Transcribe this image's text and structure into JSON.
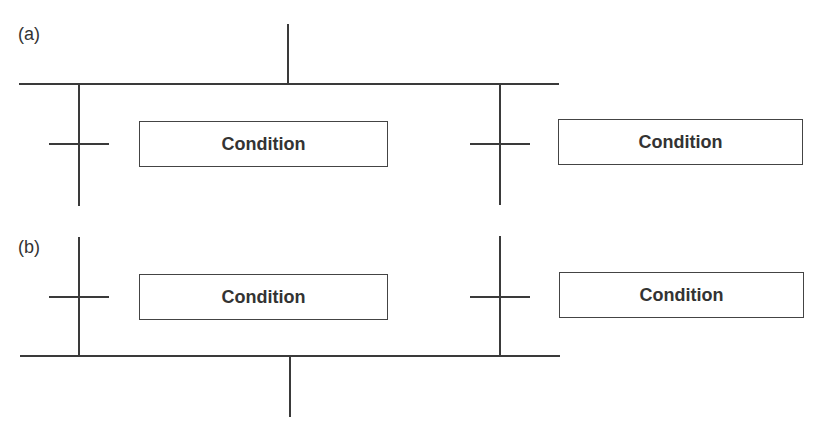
{
  "diagram": {
    "type": "sequential-function-chart-branches",
    "colors": {
      "line": "#3a3a3a",
      "text": "#333333",
      "background": "#ffffff"
    },
    "panels": [
      {
        "label": "(a)",
        "description": "divergence: single path splits into alternative branches",
        "branches": [
          {
            "transition_condition": "Condition"
          },
          {
            "transition_condition": "Condition"
          }
        ]
      },
      {
        "label": "(b)",
        "description": "convergence: alternative branches join into single path",
        "branches": [
          {
            "transition_condition": "Condition"
          },
          {
            "transition_condition": "Condition"
          }
        ]
      }
    ]
  }
}
